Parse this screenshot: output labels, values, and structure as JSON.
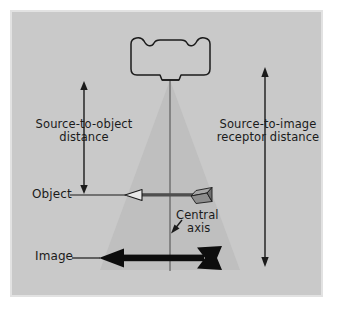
{
  "figure": {
    "background_color": "#ffffff",
    "panel_color": "#c9c9c9",
    "frame_color": "#e2e2e2",
    "beam_color": "#bfbfbf",
    "ink_color": "#1b1b1b"
  },
  "labels": {
    "source_to_object": "Source-to-object\ndistance",
    "source_to_image": "Source-to-image\nreceptor distance",
    "object": "Object",
    "image": "Image",
    "central_axis_line1": "Central",
    "central_axis_line2": "axis"
  },
  "elements": {
    "tube_housing": "x-ray-tube-housing",
    "collimator": "collimator-port",
    "beam_cone": "x-ray-beam-cone",
    "central_axis_line": "central-axis-line",
    "object_arrow": "object-arrow-outline",
    "image_arrow": "image-arrow-solid",
    "sod_dimension_arrow": "source-to-object-dimension-arrow",
    "sid_dimension_arrow": "source-to-image-dimension-arrow",
    "object_leader": "object-leader-line",
    "image_leader": "image-leader-line",
    "central_axis_pointer": "central-axis-pointer-arrow"
  },
  "geometry": {
    "beam_apex_x": 170,
    "beam_apex_y": 80,
    "beam_base_y": 270,
    "beam_base_left_x": 100,
    "beam_base_right_x": 240,
    "object_plane_y": 195,
    "image_plane_y": 258,
    "sod_arrow_top_y": 82,
    "sod_arrow_bottom_y": 193,
    "sid_arrow_top_y": 68,
    "sid_arrow_bottom_y": 266
  }
}
